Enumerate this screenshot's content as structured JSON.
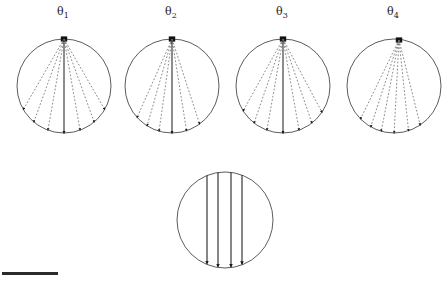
{
  "figure": {
    "background_color": "#ffffff",
    "stroke_color": "#3a3a3a",
    "circle_stroke": "#4a4a4a",
    "dash_color": "#6e6e6e",
    "solid_ray_color": "#1a1a1a",
    "scalebar_color": "#2b2b2b"
  },
  "labels": {
    "theta1": "θ",
    "theta1_sub": "1",
    "theta2": "θ",
    "theta2_sub": "2",
    "theta3": "θ",
    "theta3_sub": "3",
    "theta4": "θ",
    "theta4_sub": "4"
  },
  "chart_data": {
    "type": "scatter",
    "title": "",
    "xlabel": "",
    "ylabel": "",
    "panels": [
      {
        "name": "panel-theta1",
        "label": "θ1",
        "cx": 64,
        "cy": 86,
        "r": 47,
        "apex_x": 64,
        "apex_y": 39,
        "ray_count": 7,
        "fan_half_angle_deg": 30,
        "ray_end_angles_deg": [
          -30,
          -20,
          -10,
          0,
          10,
          20,
          30
        ],
        "ray_style": "dashed",
        "center_ray_style": "solid"
      },
      {
        "name": "panel-theta2",
        "label": "θ2",
        "cx": 172,
        "cy": 86,
        "r": 47,
        "apex_x": 172,
        "apex_y": 39,
        "ray_count": 6,
        "fan_half_angle_deg": 24,
        "ray_end_angles_deg": [
          -24,
          -16,
          -8,
          0,
          9,
          18
        ],
        "ray_style": "dashed",
        "center_ray_style": "solid"
      },
      {
        "name": "panel-theta3",
        "label": "θ3",
        "cx": 283,
        "cy": 86,
        "r": 47,
        "apex_x": 283,
        "apex_y": 39,
        "ray_count": 7,
        "fan_half_angle_deg": 29,
        "ray_end_angles_deg": [
          -29,
          -19,
          -10,
          0,
          10,
          19,
          28
        ],
        "ray_style": "dashed",
        "center_ray_style": "solid"
      },
      {
        "name": "panel-theta4",
        "label": "θ4",
        "cx": 394,
        "cy": 86,
        "r": 47,
        "apex_x": 399,
        "apex_y": 40,
        "ray_count": 6,
        "fan_half_angle_deg": 22,
        "ray_end_angles_deg": [
          -26,
          -18,
          -11,
          -3,
          6,
          14
        ],
        "ray_style": "dashed",
        "center_ray_style": "solid"
      },
      {
        "name": "panel-normal-incidence",
        "label": "",
        "cx": 225,
        "cy": 220,
        "r": 48,
        "ray_count": 4,
        "ray_style": "solid",
        "parallel": true,
        "ray_x_offsets": [
          -18,
          -7,
          6,
          17
        ]
      }
    ],
    "scalebar": {
      "x": 2,
      "y": 272,
      "width": 56,
      "height": 3,
      "label": ""
    }
  }
}
